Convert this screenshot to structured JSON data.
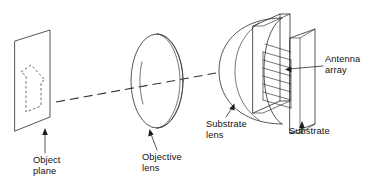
{
  "figure": {
    "background_color": "#ffffff",
    "line_color": "#2b2b2b",
    "text_color": "#111111",
    "width": 372,
    "height": 189
  },
  "labels": {
    "object_plane": "Object\nplane",
    "objective_lens": "Objective\nlens",
    "substrate_lens": "Substrate\nlens",
    "substrate": "Substrate",
    "antenna_array": "Antenna\narray"
  },
  "components": [
    {
      "id": "object-plane",
      "name": "Object plane",
      "shape": "parallelogram-screen",
      "contains": "dashed-object-outline"
    },
    {
      "id": "objective-lens",
      "name": "Objective lens",
      "shape": "ellipse-biconvex-lens"
    },
    {
      "id": "substrate-lens",
      "name": "Substrate lens",
      "shape": "hemisphere"
    },
    {
      "id": "substrate",
      "name": "Substrate",
      "shape": "rectangular-slab"
    },
    {
      "id": "antenna-array",
      "name": "Antenna array",
      "shape": "parallel-line-array"
    },
    {
      "id": "optical-axis",
      "name": "Optical axis",
      "shape": "dashed-ray-line"
    }
  ]
}
